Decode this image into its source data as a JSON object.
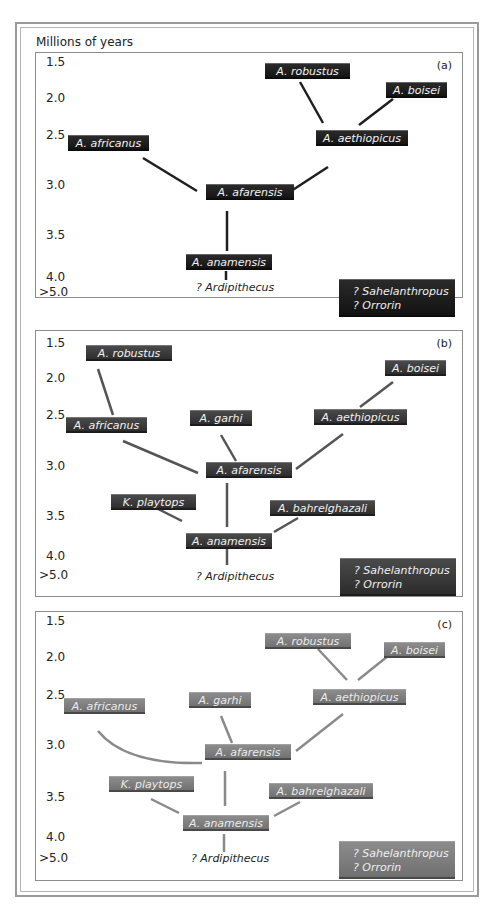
{
  "figure": {
    "y_axis_label": "Millions of years",
    "y_ticks": [
      "1.5",
      "2.0",
      "2.5",
      "3.0",
      "3.5",
      "4.0",
      ">5.0"
    ],
    "uncertain_ancestors": [
      "? Sahelanthropus",
      "? Orrorin"
    ],
    "root_label": "? Ardipithecus"
  },
  "colors": {
    "panel_a_box": "#1a1a1a",
    "panel_b_box": "#3a3a3a",
    "panel_c_box": "#7a7a7a",
    "panel_a_line": "#1f1f1f",
    "panel_b_line": "#555555",
    "panel_c_line": "#8a8a8a"
  },
  "panels": [
    {
      "label": "(a)",
      "nodes": {
        "robustus": "A. robustus",
        "boisei": "A. boisei",
        "africanus": "A. africanus",
        "aethiopicus": "A. aethiopicus",
        "afarensis": "A. afarensis",
        "anamensis": "A. anamensis"
      },
      "edges": [
        [
          "anamensis",
          "afarensis"
        ],
        [
          "afarensis",
          "africanus"
        ],
        [
          "afarensis",
          "aethiopicus"
        ],
        [
          "aethiopicus",
          "robustus"
        ],
        [
          "aethiopicus",
          "boisei"
        ],
        [
          "anamensis",
          "ardipithecus"
        ]
      ]
    },
    {
      "label": "(b)",
      "nodes": {
        "robustus": "A. robustus",
        "boisei": "A. boisei",
        "africanus": "A. africanus",
        "garhi": "A. garhi",
        "aethiopicus": "A. aethiopicus",
        "afarensis": "A. afarensis",
        "platyops": "K. playtops",
        "bahrelghazali": "A. bahrelghazali",
        "anamensis": "A. anamensis"
      },
      "edges": [
        [
          "africanus",
          "robustus"
        ],
        [
          "afarensis",
          "africanus"
        ],
        [
          "afarensis",
          "garhi"
        ],
        [
          "afarensis",
          "aethiopicus"
        ],
        [
          "aethiopicus",
          "boisei"
        ],
        [
          "anamensis",
          "afarensis"
        ],
        [
          "anamensis",
          "platyops"
        ],
        [
          "anamensis",
          "bahrelghazali"
        ],
        [
          "anamensis",
          "ardipithecus"
        ]
      ]
    },
    {
      "label": "(c)",
      "nodes": {
        "robustus": "A. robustus",
        "boisei": "A. boisei",
        "africanus": "A. africanus",
        "garhi": "A. garhi",
        "aethiopicus": "A. aethiopicus",
        "afarensis": "A. afarensis",
        "platyops": "K. playtops",
        "bahrelghazali": "A. bahrelghazali",
        "anamensis": "A. anamensis"
      },
      "edges": [
        [
          "afarensis",
          "africanus"
        ],
        [
          "afarensis",
          "garhi"
        ],
        [
          "afarensis",
          "aethiopicus"
        ],
        [
          "aethiopicus",
          "robustus"
        ],
        [
          "aethiopicus",
          "boisei"
        ],
        [
          "anamensis",
          "afarensis"
        ],
        [
          "anamensis",
          "platyops"
        ],
        [
          "anamensis",
          "bahrelghazali"
        ],
        [
          "anamensis",
          "ardipithecus"
        ]
      ]
    }
  ]
}
